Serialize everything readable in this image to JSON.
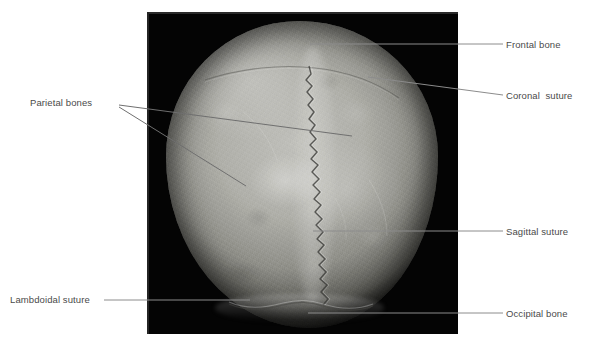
{
  "figure": {
    "view": "superior view of the cranium (skullcap)",
    "panel_background_color": "#040404",
    "bone_color": "#aeaea8",
    "leader_line_color": "#8c8c8c",
    "label_text_color": "#4a4a4a"
  },
  "labels": [
    {
      "id": "frontal-bone",
      "text": "Frontal bone",
      "side": "right",
      "text_x": 506,
      "text_y": 39,
      "leader": {
        "x1": 310,
        "y1": 44,
        "x2": 503,
        "y2": 44
      }
    },
    {
      "id": "coronal-suture",
      "text": "Coronal  suture",
      "side": "right",
      "text_x": 506,
      "text_y": 90,
      "leader": {
        "x1": 368,
        "y1": 77,
        "x2": 503,
        "y2": 95
      }
    },
    {
      "id": "sagittal-suture",
      "text": "Sagittal suture",
      "side": "right",
      "text_x": 506,
      "text_y": 226,
      "leader": {
        "x1": 313,
        "y1": 231,
        "x2": 503,
        "y2": 231
      }
    },
    {
      "id": "occipital-bone",
      "text": "Occipital bone",
      "side": "right",
      "text_x": 506,
      "text_y": 308,
      "leader": {
        "x1": 308,
        "y1": 313,
        "x2": 503,
        "y2": 313
      }
    },
    {
      "id": "parietal-bones",
      "text": "Parietal bones",
      "side": "left",
      "text_x": 30,
      "text_y": 97,
      "leaders": [
        {
          "x1": 119,
          "y1": 105,
          "x2": 352,
          "y2": 136
        },
        {
          "x1": 119,
          "y1": 107,
          "x2": 246,
          "y2": 186
        }
      ]
    },
    {
      "id": "lambdoidal-suture",
      "text": "Lambdoidal suture",
      "side": "left",
      "text_x": 10,
      "text_y": 294,
      "leader": {
        "x1": 104,
        "y1": 300,
        "x2": 250,
        "y2": 300
      }
    }
  ],
  "sutures": [
    {
      "id": "sagittal-suture-path",
      "name": "sagittal suture",
      "description": "serrated midline suture running front to back"
    },
    {
      "id": "coronal-suture-path",
      "name": "coronal suture",
      "description": "faint suture arcing across the upper cranium"
    },
    {
      "id": "lambdoidal-suture-path",
      "name": "lambdoidal suture",
      "description": "suture across the lower (occipital) margin"
    }
  ]
}
